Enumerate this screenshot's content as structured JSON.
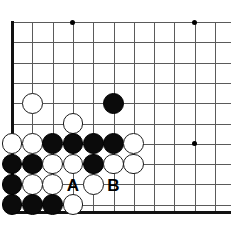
{
  "figure": {
    "board_size": 19,
    "view": "bottom-left corner, cropped",
    "width_px": 231,
    "height_px": 228
  },
  "board": {
    "origin_x": 12,
    "origin_y": 22,
    "spacing": 20.3,
    "cols": 11,
    "rows": 10,
    "stone_radius": 10.4,
    "line_color": "#5a5a5a",
    "edge_color": "#111111",
    "background_color": "#ffffff",
    "black_color": "#0b0b0b",
    "white_color": "#ffffff"
  },
  "edges": [
    {
      "name": "left-edge",
      "orientation": "v",
      "x": 12,
      "y1": 21,
      "y2": 214
    },
    {
      "name": "bottom-edge",
      "orientation": "h",
      "y": 212,
      "x1": 11,
      "x2": 231
    }
  ],
  "star_points": [
    {
      "col": 3,
      "row": 0
    },
    {
      "col": 9,
      "row": 0
    },
    {
      "col": 9,
      "row": 6
    }
  ],
  "stones": [
    {
      "color": "white",
      "col": 1,
      "row": 4
    },
    {
      "color": "black",
      "col": 5,
      "row": 4
    },
    {
      "color": "white",
      "col": 3,
      "row": 5
    },
    {
      "color": "white",
      "col": 0,
      "row": 6
    },
    {
      "color": "white",
      "col": 1,
      "row": 6
    },
    {
      "color": "black",
      "col": 2,
      "row": 6
    },
    {
      "color": "black",
      "col": 3,
      "row": 6
    },
    {
      "color": "black",
      "col": 4,
      "row": 6
    },
    {
      "color": "black",
      "col": 5,
      "row": 6
    },
    {
      "color": "white",
      "col": 6,
      "row": 6
    },
    {
      "color": "black",
      "col": 0,
      "row": 7
    },
    {
      "color": "black",
      "col": 1,
      "row": 7
    },
    {
      "color": "white",
      "col": 2,
      "row": 7
    },
    {
      "color": "white",
      "col": 3,
      "row": 7
    },
    {
      "color": "black",
      "col": 4,
      "row": 7
    },
    {
      "color": "white",
      "col": 5,
      "row": 7
    },
    {
      "color": "white",
      "col": 6,
      "row": 7
    },
    {
      "color": "black",
      "col": 0,
      "row": 8
    },
    {
      "color": "white",
      "col": 1,
      "row": 8
    },
    {
      "color": "white",
      "col": 2,
      "row": 8
    },
    {
      "color": "white",
      "col": 4,
      "row": 8
    },
    {
      "color": "black",
      "col": 0,
      "row": 9
    },
    {
      "color": "black",
      "col": 1,
      "row": 9
    },
    {
      "color": "black",
      "col": 2,
      "row": 9
    },
    {
      "color": "white",
      "col": 3,
      "row": 9
    }
  ],
  "markers": [
    {
      "label": "A",
      "col": 3,
      "row": 8
    },
    {
      "label": "B",
      "col": 5,
      "row": 8
    }
  ]
}
